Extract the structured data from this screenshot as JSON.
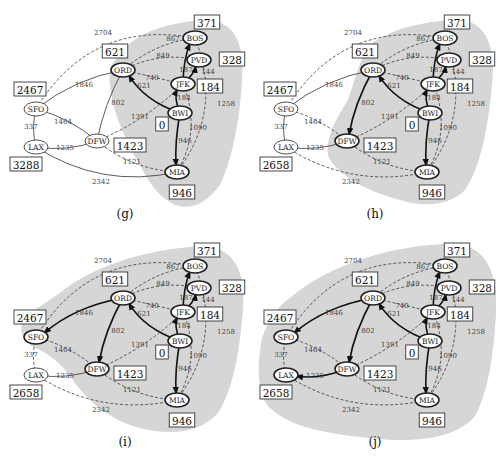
{
  "figure": {
    "colors": {
      "cloud": "#d6d6d6",
      "edge": "#333333",
      "tree_edge": "#111111",
      "background": "#ffffff"
    }
  },
  "nodes": [
    {
      "id": "BOS",
      "label": "BOS",
      "x": 195,
      "y": 38
    },
    {
      "id": "PVD",
      "label": "PVD",
      "x": 199,
      "y": 60
    },
    {
      "id": "ORD",
      "label": "ORD",
      "x": 123,
      "y": 70
    },
    {
      "id": "JFK",
      "label": "JFK",
      "x": 183,
      "y": 84
    },
    {
      "id": "BWI",
      "label": "BWI",
      "x": 180,
      "y": 113
    },
    {
      "id": "DFW",
      "label": "DFW",
      "x": 97,
      "y": 141
    },
    {
      "id": "MIA",
      "label": "MIA",
      "x": 177,
      "y": 172
    },
    {
      "id": "SFO",
      "label": "SFO",
      "x": 36,
      "y": 109
    },
    {
      "id": "LAX",
      "label": "LAX",
      "x": 36,
      "y": 147
    }
  ],
  "edges": [
    {
      "a": "SFO",
      "b": "BOS",
      "w": "2704",
      "lx": 103,
      "ly": 35
    },
    {
      "a": "ORD",
      "b": "BOS",
      "w": "867",
      "lx": 173,
      "ly": 41
    },
    {
      "a": "ORD",
      "b": "PVD",
      "w": "849",
      "lx": 163,
      "ly": 58
    },
    {
      "a": "ORD",
      "b": "JFK",
      "w": "740",
      "lx": 152,
      "ly": 80
    },
    {
      "a": "BWI",
      "b": "ORD",
      "w": "621",
      "lx": 144,
      "ly": 88
    },
    {
      "a": "JFK",
      "b": "BOS",
      "w": "187",
      "lx": 186,
      "ly": 72
    },
    {
      "a": "JFK",
      "b": "PVD",
      "w": "144",
      "lx": 208,
      "ly": 74
    },
    {
      "a": "BWI",
      "b": "JFK",
      "w": "184",
      "lx": 184,
      "ly": 100
    },
    {
      "a": "BWI",
      "b": "MIA",
      "w": "946",
      "lx": 185,
      "ly": 143
    },
    {
      "a": "JFK",
      "b": "MIA",
      "w": "1090",
      "lx": 198,
      "ly": 130
    },
    {
      "a": "BOS",
      "b": "MIA",
      "w": "1258",
      "lx": 226,
      "ly": 106
    },
    {
      "a": "ORD",
      "b": "DFW",
      "w": "802",
      "lx": 118,
      "ly": 105
    },
    {
      "a": "DFW",
      "b": "JFK",
      "w": "1391",
      "lx": 140,
      "ly": 119
    },
    {
      "a": "DFW",
      "b": "MIA",
      "w": "1121",
      "lx": 132,
      "ly": 164
    },
    {
      "a": "SFO",
      "b": "ORD",
      "w": "1846",
      "lx": 84,
      "ly": 87
    },
    {
      "a": "SFO",
      "b": "DFW",
      "w": "1464",
      "lx": 63,
      "ly": 124
    },
    {
      "a": "SFO",
      "b": "LAX",
      "w": "337",
      "lx": 31,
      "ly": 129
    },
    {
      "a": "LAX",
      "b": "DFW",
      "w": "1235",
      "lx": 65,
      "ly": 150
    },
    {
      "a": "LAX",
      "b": "MIA",
      "w": "2342",
      "lx": 101,
      "ly": 184
    }
  ],
  "panels": [
    {
      "id": "g",
      "caption": "(g)",
      "offset": [
        0,
        0
      ],
      "distances": {
        "BOS": "371",
        "PVD": "328",
        "ORD": "621",
        "JFK": "184",
        "BWI": "0",
        "DFW": "1423",
        "MIA": "946",
        "SFO": "2467",
        "LAX": "3288"
      },
      "cloud_nodes": [
        "BOS",
        "PVD",
        "ORD",
        "JFK",
        "BWI",
        "MIA"
      ],
      "tree_edges": [
        "BWI-ORD",
        "BWI-JFK",
        "JFK-BOS",
        "JFK-PVD",
        "BWI-MIA"
      ],
      "dashed_edges": [
        "SFO-BOS",
        "ORD-BOS",
        "ORD-PVD",
        "ORD-JFK",
        "JFK-MIA",
        "BOS-MIA",
        "DFW-JFK",
        "DFW-MIA"
      ]
    },
    {
      "id": "h",
      "caption": "(h)",
      "offset": [
        250,
        0
      ],
      "distances": {
        "BOS": "371",
        "PVD": "328",
        "ORD": "621",
        "JFK": "184",
        "BWI": "0",
        "DFW": "1423",
        "MIA": "946",
        "SFO": "2467",
        "LAX": "2658"
      },
      "cloud_nodes": [
        "BOS",
        "PVD",
        "ORD",
        "JFK",
        "BWI",
        "MIA",
        "DFW"
      ],
      "tree_edges": [
        "BWI-ORD",
        "BWI-JFK",
        "JFK-BOS",
        "JFK-PVD",
        "BWI-MIA",
        "ORD-DFW"
      ],
      "dashed_edges": [
        "SFO-BOS",
        "ORD-BOS",
        "ORD-PVD",
        "ORD-JFK",
        "JFK-MIA",
        "BOS-MIA",
        "DFW-JFK",
        "DFW-MIA",
        "SFO-DFW",
        "LAX-MIA"
      ]
    },
    {
      "id": "i",
      "caption": "(i)",
      "offset": [
        0,
        228
      ],
      "distances": {
        "BOS": "371",
        "PVD": "328",
        "ORD": "621",
        "JFK": "184",
        "BWI": "0",
        "DFW": "1423",
        "MIA": "946",
        "SFO": "2467",
        "LAX": "2658"
      },
      "cloud_nodes": [
        "BOS",
        "PVD",
        "ORD",
        "JFK",
        "BWI",
        "MIA",
        "DFW",
        "SFO"
      ],
      "tree_edges": [
        "BWI-ORD",
        "BWI-JFK",
        "JFK-BOS",
        "JFK-PVD",
        "BWI-MIA",
        "ORD-DFW",
        "ORD-SFO"
      ],
      "dashed_edges": [
        "SFO-BOS",
        "ORD-BOS",
        "ORD-PVD",
        "ORD-JFK",
        "JFK-MIA",
        "BOS-MIA",
        "DFW-JFK",
        "DFW-MIA",
        "SFO-DFW",
        "LAX-MIA",
        "SFO-LAX"
      ]
    },
    {
      "id": "j",
      "caption": "(j)",
      "offset": [
        250,
        228
      ],
      "distances": {
        "BOS": "371",
        "PVD": "328",
        "ORD": "621",
        "JFK": "184",
        "BWI": "0",
        "DFW": "1423",
        "MIA": "946",
        "SFO": "2467",
        "LAX": "2658"
      },
      "cloud_nodes": [
        "BOS",
        "PVD",
        "ORD",
        "JFK",
        "BWI",
        "MIA",
        "DFW",
        "SFO",
        "LAX"
      ],
      "tree_edges": [
        "BWI-ORD",
        "BWI-JFK",
        "JFK-BOS",
        "JFK-PVD",
        "BWI-MIA",
        "ORD-DFW",
        "ORD-SFO",
        "DFW-LAX"
      ],
      "dashed_edges": [
        "SFO-BOS",
        "ORD-BOS",
        "ORD-PVD",
        "ORD-JFK",
        "JFK-MIA",
        "BOS-MIA",
        "DFW-JFK",
        "DFW-MIA",
        "SFO-DFW",
        "LAX-MIA",
        "SFO-LAX"
      ]
    }
  ]
}
